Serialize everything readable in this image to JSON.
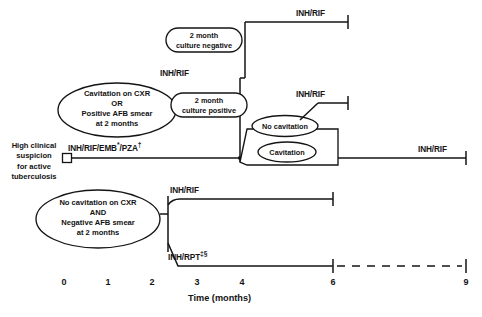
{
  "diagram": {
    "title_hidden": "",
    "axis": {
      "label": "Time (months)",
      "ticks": [
        "0",
        "1",
        "2",
        "3",
        "4",
        "6",
        "9"
      ],
      "tick_values": [
        0,
        1,
        2,
        3,
        4,
        6,
        9
      ]
    },
    "start_node": {
      "lines": [
        "High clinical",
        "suspicion",
        "for active",
        "tuberculosis"
      ]
    },
    "initial_phase": {
      "label_plain": "INH/RIF/EMB*/PZA†",
      "drug_main": "INH/RIF/EMB",
      "mark1": "*",
      "drug_second": "/PZA",
      "mark2": "†",
      "start_month": 0,
      "end_month": 2
    },
    "decision_nodes": [
      {
        "name": "cavitation-positive-smear",
        "lines": [
          "Cavitation on CXR",
          "OR",
          "Positive AFB smear",
          "at 2 months"
        ]
      },
      {
        "name": "no-cavitation-negative-smear",
        "lines": [
          "No cavitation on CXR",
          "AND",
          "Negative AFB smear",
          "at 2 months"
        ]
      }
    ],
    "culture_nodes": [
      {
        "name": "culture-negative",
        "lines": [
          "2 month",
          "culture negative"
        ]
      },
      {
        "name": "culture-positive",
        "lines": [
          "2 month",
          "culture positive"
        ]
      }
    ],
    "cavitation_nodes": [
      {
        "name": "no-cavitation",
        "label": "No cavitation"
      },
      {
        "name": "cavitation",
        "label": "Cavitation"
      }
    ],
    "continuation_regimens": [
      {
        "name": "inh-rif-culture-negative-top",
        "label": "INH/RIF",
        "start_month": 4,
        "end_month": 6
      },
      {
        "name": "inh-rif-branch-junction",
        "label": "INH/RIF",
        "start_month": 2,
        "end_month": 4
      },
      {
        "name": "inh-rif-no-cavitation",
        "label": "INH/RIF",
        "start_month": 4.6,
        "end_month": 6
      },
      {
        "name": "inh-rif-cavitation",
        "label": "INH/RIF",
        "start_month": 4.6,
        "end_month": 9
      },
      {
        "name": "inh-rif-lower",
        "label": "INH/RIF",
        "start_month": 2.3,
        "end_month": 6
      },
      {
        "name": "inh-rpt-lower",
        "label_main": "INH/RPT",
        "marks": "‡§",
        "start_month": 2.3,
        "end_month": 6,
        "dashed_to_month": 9
      }
    ],
    "colors": {
      "ink": "#141414",
      "background": "#ffffff"
    }
  }
}
